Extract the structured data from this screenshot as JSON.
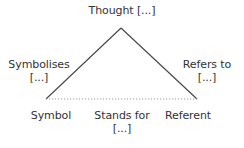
{
  "diagram": {
    "type": "semiotic-triangle",
    "colors": {
      "line": "#444444",
      "dotted_line": "#999999",
      "text": "#333333",
      "background": "#ffffff"
    },
    "nodes": {
      "top": {
        "label": "Thought [...]"
      },
      "bottom_left": {
        "label": "Symbol"
      },
      "bottom_right": {
        "label": "Referent"
      }
    },
    "edges": {
      "left": {
        "line1": "Symbolises",
        "line2": "[...]",
        "style": "solid"
      },
      "right": {
        "line1": "Refers to",
        "line2": "[...]",
        "style": "solid"
      },
      "base": {
        "line1": "Stands for",
        "line2": "[...]",
        "style": "dotted"
      }
    }
  }
}
